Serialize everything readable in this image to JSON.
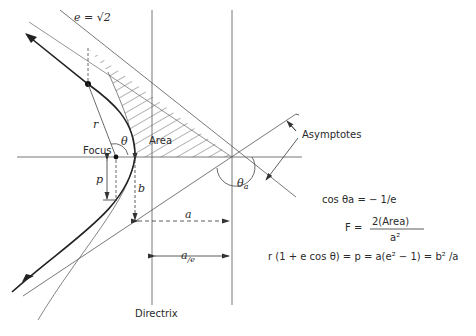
{
  "diagram": {
    "type": "hyperbolic-trajectory-geometry",
    "labels": {
      "eccentricity": "e = √2",
      "r": "r",
      "theta": "θ",
      "area": "Area",
      "focus": "Focus",
      "p": "p",
      "b": "b",
      "a": "a",
      "a_over_e_main": "a",
      "a_over_e_sub": "/e",
      "theta_a": "θ",
      "theta_a_sub": "a",
      "asymptotes": "Asymptotes",
      "directrix": "Directrix"
    },
    "equations": {
      "eq1": "cos θa = − 1/e",
      "eq2_lhs": "F  =",
      "eq2_num": "2(Area)",
      "eq2_den": "a²",
      "eq3": "r (1 + e cos θ) = p = a(e² − 1) = b² /a"
    },
    "colors": {
      "line": "#3a3a3a",
      "thin_line": "#6a6a6a",
      "background": "#ffffff"
    }
  }
}
